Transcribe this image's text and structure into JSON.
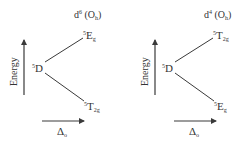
{
  "diagram": {
    "type": "orgel-diagram-pair",
    "colors": {
      "line": "#3a3a3a",
      "text": "#333333",
      "background": "#ffffff"
    },
    "panels": [
      {
        "id": "d6",
        "config_prefix": "d",
        "config_sup": "6",
        "config_suffix": "(O",
        "config_sub": "h",
        "config_close": ")",
        "axis_y_label": "Energy",
        "axis_x_label_main": "Δ",
        "axis_x_label_sub": "o",
        "center_term": {
          "sup": "5",
          "main": "D"
        },
        "upper_term": {
          "sup": "5",
          "main": "E",
          "sub": "g"
        },
        "lower_term": {
          "sup": "5",
          "main": "T",
          "sub": "2g"
        }
      },
      {
        "id": "d4",
        "config_prefix": "d",
        "config_sup": "4",
        "config_suffix": "(O",
        "config_sub": "h",
        "config_close": ")",
        "axis_y_label": "Energy",
        "axis_x_label_main": "Δ",
        "axis_x_label_sub": "o",
        "center_term": {
          "sup": "5",
          "main": "D"
        },
        "upper_term": {
          "sup": "5",
          "main": "T",
          "sub": "2g"
        },
        "lower_term": {
          "sup": "5",
          "main": "E",
          "sub": "g"
        }
      }
    ]
  }
}
